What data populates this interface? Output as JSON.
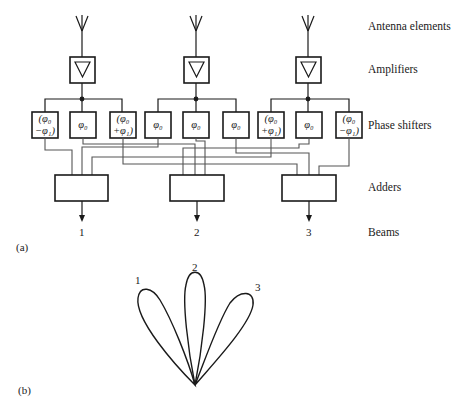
{
  "figure": {
    "part_a_label": "(a)",
    "part_b_label": "(b)"
  },
  "row_labels": {
    "antennas": "Antenna elements",
    "amplifiers": "Amplifiers",
    "phase_shifters": "Phase shifters",
    "adders": "Adders",
    "beams": "Beams"
  },
  "phase_shifters": [
    {
      "line1": "(φ₀",
      "line2": "−φ₁)"
    },
    {
      "line1": "φ₀",
      "line2": ""
    },
    {
      "line1": "(φ₀",
      "line2": "+φ₁)"
    },
    {
      "line1": "φ₀",
      "line2": ""
    },
    {
      "line1": "φ₀",
      "line2": ""
    },
    {
      "line1": "φ₀",
      "line2": ""
    },
    {
      "line1": "(φ₀",
      "line2": "+φ₁)"
    },
    {
      "line1": "φ₀",
      "line2": ""
    },
    {
      "line1": "(φ₀",
      "line2": "−φ₁)"
    }
  ],
  "beams": [
    "1",
    "2",
    "3"
  ],
  "lobes": {
    "labels": [
      "1",
      "2",
      "3"
    ]
  },
  "colors": {
    "line": "#1a1a1a",
    "wire": "#555555",
    "background": "#ffffff"
  }
}
